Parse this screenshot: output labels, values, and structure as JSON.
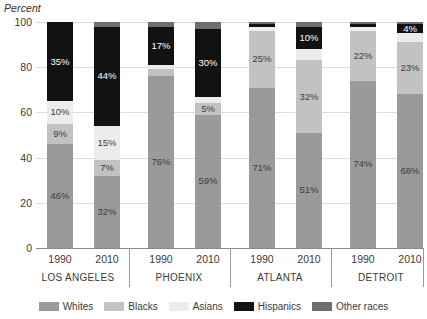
{
  "chart_data": {
    "type": "bar",
    "subtype": "stacked-bar",
    "title": "",
    "ylabel": "Percent",
    "xlabel": "",
    "ylim": [
      0,
      100
    ],
    "yticks": [
      0,
      20,
      40,
      60,
      80,
      100
    ],
    "grid": true,
    "legend_position": "bottom",
    "legend": [
      "Whites",
      "Blacks",
      "Asians",
      "Hispanics",
      "Other races"
    ],
    "stack_order_bottom_to_top": [
      "Whites",
      "Blacks",
      "Asians",
      "Hispanics",
      "Other races"
    ],
    "groups": [
      "LOS ANGELES",
      "PHOENIX",
      "ATLANTA",
      "DETROIT"
    ],
    "years": [
      "1990",
      "2010"
    ],
    "categories": [
      "LOS ANGELES 1990",
      "LOS ANGELES 2010",
      "PHOENIX 1990",
      "PHOENIX 2010",
      "ATLANTA 1990",
      "ATLANTA 2010",
      "DETROIT 1990",
      "DETROIT 2010"
    ],
    "series": [
      {
        "name": "Whites",
        "values": [
          46,
          32,
          76,
          59,
          71,
          51,
          74,
          68
        ]
      },
      {
        "name": "Blacks",
        "values": [
          9,
          7,
          3,
          5,
          25,
          32,
          22,
          23
        ]
      },
      {
        "name": "Asians",
        "values": [
          10,
          15,
          2,
          3,
          2,
          5,
          2,
          4
        ]
      },
      {
        "name": "Hispanics",
        "values": [
          35,
          44,
          17,
          30,
          1,
          10,
          1,
          4
        ]
      },
      {
        "name": "Other races",
        "values": [
          0,
          2,
          2,
          3,
          1,
          2,
          1,
          1
        ]
      }
    ]
  },
  "axis_title": "Percent",
  "ytick_labels": [
    "100",
    "80",
    "60",
    "40",
    "20",
    "0"
  ],
  "colors": {
    "whites": "#9a9a9a",
    "blacks": "#c2c2c2",
    "asians": "#ececec",
    "hispanics": "#121212",
    "other": "#6e6e6e",
    "gridline": "#d8dce4",
    "axis": "#8a8a8a",
    "text": "#3a3a3a"
  },
  "legend_items": [
    {
      "label": "Whites",
      "key": "whites"
    },
    {
      "label": "Blacks",
      "key": "blacks"
    },
    {
      "label": "Asians",
      "key": "asians"
    },
    {
      "label": "Hispanics",
      "key": "hispanics"
    },
    {
      "label": "Other races",
      "key": "other"
    }
  ],
  "bars": [
    {
      "group": "LOS ANGELES",
      "year": "1990",
      "x": 11,
      "segments": [
        {
          "key": "whites",
          "value": 46,
          "label": "46%",
          "show": true,
          "text": "dark"
        },
        {
          "key": "blacks",
          "value": 9,
          "label": "9%",
          "show": true,
          "text": "dark"
        },
        {
          "key": "asians",
          "value": 10,
          "label": "10%",
          "show": true,
          "text": "dark"
        },
        {
          "key": "hispanics",
          "value": 35,
          "label": "35%",
          "show": true,
          "text": "light"
        },
        {
          "key": "other",
          "value": 0,
          "label": "",
          "show": false,
          "text": "dark"
        }
      ]
    },
    {
      "group": "LOS ANGELES",
      "year": "2010",
      "x": 58,
      "segments": [
        {
          "key": "whites",
          "value": 32,
          "label": "32%",
          "show": true,
          "text": "dark"
        },
        {
          "key": "blacks",
          "value": 7,
          "label": "7%",
          "show": true,
          "text": "dark"
        },
        {
          "key": "asians",
          "value": 15,
          "label": "15%",
          "show": true,
          "text": "dark"
        },
        {
          "key": "hispanics",
          "value": 44,
          "label": "44%",
          "show": true,
          "text": "light"
        },
        {
          "key": "other",
          "value": 2,
          "label": "",
          "show": false,
          "text": "dark"
        }
      ]
    },
    {
      "group": "PHOENIX",
      "year": "1990",
      "x": 112,
      "segments": [
        {
          "key": "whites",
          "value": 76,
          "label": "76%",
          "show": true,
          "text": "dark"
        },
        {
          "key": "blacks",
          "value": 3,
          "label": "",
          "show": false,
          "text": "dark"
        },
        {
          "key": "asians",
          "value": 2,
          "label": "",
          "show": false,
          "text": "dark"
        },
        {
          "key": "hispanics",
          "value": 17,
          "label": "17%",
          "show": true,
          "text": "light"
        },
        {
          "key": "other",
          "value": 2,
          "label": "",
          "show": false,
          "text": "dark"
        }
      ]
    },
    {
      "group": "PHOENIX",
      "year": "2010",
      "x": 159,
      "segments": [
        {
          "key": "whites",
          "value": 59,
          "label": "59%",
          "show": true,
          "text": "dark"
        },
        {
          "key": "blacks",
          "value": 5,
          "label": "5%",
          "show": true,
          "text": "dark"
        },
        {
          "key": "asians",
          "value": 3,
          "label": "",
          "show": false,
          "text": "dark"
        },
        {
          "key": "hispanics",
          "value": 30,
          "label": "30%",
          "show": true,
          "text": "light"
        },
        {
          "key": "other",
          "value": 3,
          "label": "",
          "show": false,
          "text": "dark"
        }
      ]
    },
    {
      "group": "ATLANTA",
      "year": "1990",
      "x": 213,
      "segments": [
        {
          "key": "whites",
          "value": 71,
          "label": "71%",
          "show": true,
          "text": "dark"
        },
        {
          "key": "blacks",
          "value": 25,
          "label": "25%",
          "show": true,
          "text": "dark"
        },
        {
          "key": "asians",
          "value": 2,
          "label": "",
          "show": false,
          "text": "dark"
        },
        {
          "key": "hispanics",
          "value": 1,
          "label": "",
          "show": false,
          "text": "light"
        },
        {
          "key": "other",
          "value": 1,
          "label": "",
          "show": false,
          "text": "dark"
        }
      ]
    },
    {
      "group": "ATLANTA",
      "year": "2010",
      "x": 260,
      "segments": [
        {
          "key": "whites",
          "value": 51,
          "label": "51%",
          "show": true,
          "text": "dark"
        },
        {
          "key": "blacks",
          "value": 32,
          "label": "32%",
          "show": true,
          "text": "dark"
        },
        {
          "key": "asians",
          "value": 5,
          "label": "",
          "show": false,
          "text": "dark"
        },
        {
          "key": "hispanics",
          "value": 10,
          "label": "10%",
          "show": true,
          "text": "light"
        },
        {
          "key": "other",
          "value": 2,
          "label": "",
          "show": false,
          "text": "dark"
        }
      ]
    },
    {
      "group": "DETROIT",
      "year": "1990",
      "x": 314,
      "segments": [
        {
          "key": "whites",
          "value": 74,
          "label": "74%",
          "show": true,
          "text": "dark"
        },
        {
          "key": "blacks",
          "value": 22,
          "label": "22%",
          "show": true,
          "text": "dark"
        },
        {
          "key": "asians",
          "value": 2,
          "label": "",
          "show": false,
          "text": "dark"
        },
        {
          "key": "hispanics",
          "value": 1,
          "label": "",
          "show": false,
          "text": "light"
        },
        {
          "key": "other",
          "value": 1,
          "label": "",
          "show": false,
          "text": "dark"
        }
      ]
    },
    {
      "group": "DETROIT",
      "year": "2010",
      "x": 361,
      "segments": [
        {
          "key": "whites",
          "value": 68,
          "label": "68%",
          "show": true,
          "text": "dark"
        },
        {
          "key": "blacks",
          "value": 23,
          "label": "23%",
          "show": true,
          "text": "dark"
        },
        {
          "key": "asians",
          "value": 4,
          "label": "",
          "show": false,
          "text": "dark"
        },
        {
          "key": "hispanics",
          "value": 4,
          "label": "4%",
          "show": true,
          "text": "light"
        },
        {
          "key": "other",
          "value": 1,
          "label": "",
          "show": false,
          "text": "dark"
        }
      ]
    }
  ],
  "group_labels": [
    {
      "label": "LOS ANGELES",
      "center": 42
    },
    {
      "label": "PHOENIX",
      "center": 143
    },
    {
      "label": "ATLANTA",
      "center": 244
    },
    {
      "label": "DETROIT",
      "center": 345
    }
  ],
  "group_separators": [
    93,
    194,
    295,
    387
  ]
}
